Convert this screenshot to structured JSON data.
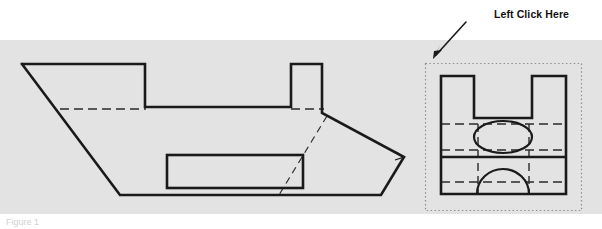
{
  "figure": {
    "background_color": "#ffffff",
    "band_color": "#e3e3e3",
    "line_color": "#1a1a1a",
    "hidden_line_color": "#2b2b2b",
    "selection_box_color": "#9a9a9a",
    "caption_text": "Figure 1"
  },
  "annotation": {
    "label": "Left Click Here",
    "arrow_from_x": 466,
    "arrow_from_y": 22,
    "arrow_to_x": 433,
    "arrow_to_y": 58
  },
  "drawings": {
    "pictorial": {
      "name": "oblique-pictorial-view",
      "outline_points": "22,64 145,64 145,107 291,107 291,64 322,64 322,112 404,157 404,159 381,195 120,195 22,64",
      "visible_edges": [
        {
          "name": "top-left-edge",
          "points": "22,64 145,64"
        },
        {
          "name": "notch-left-edge",
          "points": "145,64 145,107"
        },
        {
          "name": "notch-bottom-edge",
          "points": "145,107 291,107"
        },
        {
          "name": "notch-right-edge",
          "points": "291,107 291,64"
        },
        {
          "name": "boss-top-edge",
          "points": "291,64 322,64"
        },
        {
          "name": "boss-right-edge",
          "points": "322,64 322,112"
        },
        {
          "name": "nose-upper-edge",
          "points": "322,112 404,158"
        },
        {
          "name": "nose-lower-edge",
          "points": "404,158 381,195"
        },
        {
          "name": "bottom-edge",
          "points": "381,195 120,195"
        },
        {
          "name": "front-slope-edge",
          "points": "120,195 22,64"
        },
        {
          "name": "nose-tip-notch",
          "points": "397,153 404,158 396,160"
        }
      ],
      "hidden_edges": [
        {
          "name": "hidden-top-horizontal",
          "points": "60,109 145,109"
        },
        {
          "name": "hidden-boss-base",
          "points": "291,109 323,109"
        },
        {
          "name": "hidden-slot-diagonal",
          "points": "326,117 279,194"
        }
      ],
      "inner_rectangle": {
        "name": "center-slot",
        "x": 167,
        "y": 155,
        "width": 136,
        "height": 33
      }
    },
    "orthographic": {
      "name": "front-orthographic-view",
      "selection_box": {
        "x": 425,
        "y": 63,
        "width": 157,
        "height": 148
      },
      "body_rect": {
        "x": 441,
        "y": 76,
        "width": 125,
        "height": 118
      },
      "prong_left": {
        "x": 441,
        "y": 76,
        "width": 33,
        "height": 42
      },
      "prong_right": {
        "x": 532,
        "y": 76,
        "width": 34,
        "height": 42
      },
      "web_top_y": 118,
      "mid_divider_y": 157,
      "visible_edges": [
        {
          "name": "left-prong-top",
          "points": "441,76 474,76"
        },
        {
          "name": "left-prong-right",
          "points": "474,76 474,118"
        },
        {
          "name": "web-top-span",
          "points": "474,118 532,118"
        },
        {
          "name": "right-prong-left",
          "points": "532,118 532,76"
        },
        {
          "name": "right-prong-top",
          "points": "532,76 566,76"
        },
        {
          "name": "right-outer-edge",
          "points": "566,76 566,194"
        },
        {
          "name": "bottom-edge",
          "points": "566,194 441,194"
        },
        {
          "name": "left-outer-edge",
          "points": "441,194 441,76"
        },
        {
          "name": "mid-divider",
          "points": "441,157 566,157"
        }
      ],
      "hidden_edges": [
        {
          "name": "hidden-upper-horizontal",
          "points": "441,124 566,124"
        },
        {
          "name": "hidden-lower-horizontal-upper-bay",
          "points": "441,150 566,150"
        },
        {
          "name": "hidden-horizontal-lower-bay",
          "points": "441,182 566,182"
        },
        {
          "name": "hidden-vertical-left",
          "points": "478,124 478,194"
        },
        {
          "name": "hidden-vertical-right",
          "points": "529,124 529,194"
        }
      ],
      "ellipse": {
        "name": "through-hole-ellipse",
        "cx": 503,
        "cy": 137,
        "rx": 29,
        "ry": 16
      },
      "arc": {
        "name": "half-round-arc",
        "cx": 503,
        "cy": 194,
        "rx": 26,
        "ry": 25
      }
    }
  }
}
